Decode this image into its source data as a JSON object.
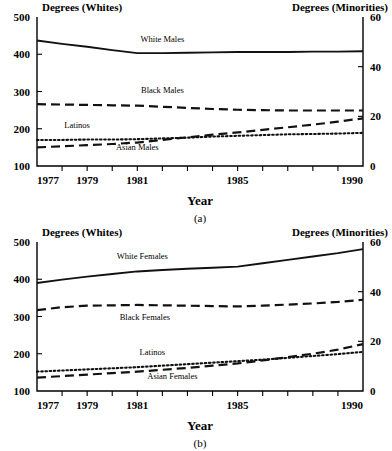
{
  "figure": {
    "panels": [
      {
        "caption": "(a)",
        "left_axis_header": "Degrees (Whites)",
        "right_axis_header": "Degrees (Minorities)",
        "xlabel": "Year"
      },
      {
        "caption": "(b)",
        "left_axis_header": "Degrees (Whites)",
        "right_axis_header": "Degrees (Minorities)",
        "xlabel": "Year"
      }
    ]
  },
  "chart_data": [
    {
      "type": "line",
      "title": "",
      "panel": "(a)",
      "xlabel": "Year",
      "ylabel": "Degrees (Whites)",
      "y2label": "Degrees (Minorities)",
      "xlim": [
        1977,
        1990
      ],
      "ylim": [
        100,
        500
      ],
      "y2lim": [
        0,
        60
      ],
      "xticks": [
        1977,
        1978,
        1979,
        1980,
        1981,
        1982,
        1983,
        1984,
        1985,
        1986,
        1987,
        1988,
        1989,
        1990
      ],
      "xticklabels": [
        "1977",
        "",
        "1979",
        "",
        "1981",
        "",
        "",
        "",
        "1985",
        "",
        "",
        "",
        "",
        "1990"
      ],
      "yticks": [
        100,
        200,
        300,
        400,
        500
      ],
      "yticklabels": [
        "100",
        "200",
        "300",
        "400",
        "500"
      ],
      "y2ticks": [
        0,
        20,
        40,
        60
      ],
      "y2ticklabels": [
        "0",
        "20",
        "40",
        "60"
      ],
      "grid": false,
      "legend": "in-plot annotations",
      "x": [
        1977,
        1978,
        1979,
        1980,
        1981,
        1982,
        1983,
        1984,
        1985,
        1986,
        1987,
        1988,
        1989,
        1990
      ],
      "series": [
        {
          "name": "White Males",
          "axis": "left",
          "style": "solid",
          "label_x": 1982.0,
          "label_y": 432,
          "values": [
            437,
            428,
            420,
            411,
            403,
            403,
            404,
            405,
            406,
            406,
            406,
            407,
            407,
            408
          ]
        },
        {
          "name": "Black Males",
          "axis": "left",
          "style": "dashed",
          "label_x": 1982.0,
          "label_y": 296,
          "values": [
            266,
            265,
            264,
            263,
            262,
            259,
            256,
            253,
            251,
            250,
            249,
            249,
            249,
            249
          ]
        },
        {
          "name": "Latinos",
          "axis": "left",
          "style": "dotted",
          "label_x": 1978.6,
          "label_y": 203,
          "values": [
            170,
            170,
            171,
            171,
            172,
            174,
            176,
            179,
            181,
            183,
            185,
            186,
            187,
            189
          ]
        },
        {
          "name": "Asian Males",
          "axis": "left",
          "style": "dashed",
          "label_x": 1981.0,
          "label_y": 143,
          "values": [
            150,
            153,
            156,
            159,
            163,
            170,
            177,
            184,
            190,
            197,
            204,
            211,
            219,
            228
          ]
        }
      ]
    },
    {
      "type": "line",
      "title": "",
      "panel": "(b)",
      "xlabel": "Year",
      "ylabel": "Degrees (Whites)",
      "y2label": "Degrees (Minorities)",
      "xlim": [
        1977,
        1990
      ],
      "ylim": [
        100,
        500
      ],
      "y2lim": [
        0,
        60
      ],
      "xticks": [
        1977,
        1978,
        1979,
        1980,
        1981,
        1982,
        1983,
        1984,
        1985,
        1986,
        1987,
        1988,
        1989,
        1990
      ],
      "xticklabels": [
        "1977",
        "",
        "1979",
        "",
        "1981",
        "",
        "",
        "",
        "1985",
        "",
        "",
        "",
        "",
        "1990"
      ],
      "yticks": [
        100,
        200,
        300,
        400,
        500
      ],
      "yticklabels": [
        "100",
        "200",
        "300",
        "400",
        "500"
      ],
      "y2ticks": [
        0,
        20,
        40,
        60
      ],
      "y2ticklabels": [
        "0",
        "20",
        "40",
        "60"
      ],
      "grid": false,
      "legend": "in-plot annotations",
      "x": [
        1977,
        1978,
        1979,
        1980,
        1981,
        1982,
        1983,
        1984,
        1985,
        1986,
        1987,
        1988,
        1989,
        1990
      ],
      "series": [
        {
          "name": "White Females",
          "axis": "left",
          "style": "solid",
          "label_x": 1981.2,
          "label_y": 455,
          "values": [
            390,
            399,
            407,
            414,
            421,
            425,
            428,
            431,
            434,
            443,
            452,
            461,
            470,
            481
          ]
        },
        {
          "name": "Black Females",
          "axis": "left",
          "style": "dashed",
          "label_x": 1981.3,
          "label_y": 290,
          "values": [
            317,
            325,
            329,
            330,
            331,
            330,
            329,
            328,
            327,
            329,
            332,
            335,
            339,
            345
          ]
        },
        {
          "name": "Latinos",
          "axis": "left",
          "style": "dotted",
          "label_x": 1981.6,
          "label_y": 196,
          "values": [
            152,
            155,
            158,
            161,
            164,
            168,
            172,
            176,
            180,
            184,
            189,
            194,
            199,
            205
          ]
        },
        {
          "name": "Asian Females",
          "axis": "left",
          "style": "dashed",
          "label_x": 1982.4,
          "label_y": 132,
          "values": [
            136,
            140,
            144,
            148,
            152,
            157,
            162,
            168,
            174,
            182,
            191,
            200,
            211,
            226
          ]
        }
      ]
    }
  ]
}
